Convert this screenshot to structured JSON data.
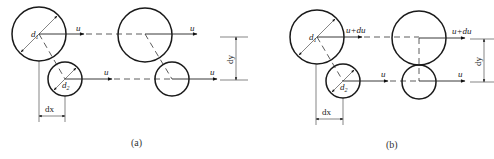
{
  "figure": {
    "panels": [
      {
        "id": "a",
        "caption": "(a)",
        "labels": {
          "d1": "d",
          "d1_sub": "1",
          "d2": "d",
          "d2_sub": "2",
          "u_top_left": "u",
          "u_bottom_left": "u",
          "u_top_right": "u",
          "u_bottom_right": "u",
          "dx": "dx",
          "dy": "dy"
        }
      },
      {
        "id": "b",
        "caption": "(b)",
        "labels": {
          "d1": "d",
          "d1_sub": "1",
          "d2": "d",
          "d2_sub": "2",
          "u_top_left": "u+du",
          "u_bottom_left": "u",
          "u_top_right": "u+du",
          "u_bottom_right": "u",
          "dx": "dx",
          "dy": "dy"
        }
      }
    ]
  }
}
